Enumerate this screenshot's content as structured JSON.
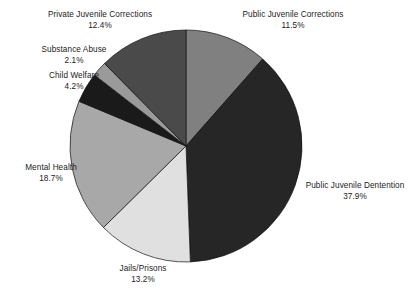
{
  "chart_data": {
    "type": "pie",
    "title": "",
    "subtitle": "",
    "xlabel": "",
    "ylabel": "",
    "legend_position": "none",
    "grid": false,
    "labels_show_percent": true,
    "start_angle_deg": 0,
    "direction": "clockwise",
    "categories": [
      "Public Juvenile Corrections",
      "Public Juvenile Dentention",
      "Jails/Prisons",
      "Mental Health",
      "Child Welfare",
      "Substance Abuse",
      "Private Juvenile Corrections"
    ],
    "values": [
      11.5,
      37.9,
      13.2,
      18.7,
      4.2,
      2.1,
      12.4
    ],
    "units": "percent",
    "total": 100.0,
    "slices": [
      {
        "label": "Public Juvenile Corrections",
        "percent_text": "11.5%",
        "value": 11.5,
        "color": "#808080"
      },
      {
        "label": "Public Juvenile Dentention",
        "percent_text": "37.9%",
        "value": 37.9,
        "color": "#262626"
      },
      {
        "label": "Jails/Prisons",
        "percent_text": "13.2%",
        "value": 13.2,
        "color": "#e0e0e0"
      },
      {
        "label": "Mental Health",
        "percent_text": "18.7%",
        "value": 18.7,
        "color": "#a8a8a8"
      },
      {
        "label": "Child Welfare",
        "percent_text": "4.2%",
        "value": 4.2,
        "color": "#1a1a1a"
      },
      {
        "label": "Substance Abuse",
        "percent_text": "2.1%",
        "value": 2.1,
        "color": "#9a9a9a"
      },
      {
        "label": "Private Juvenile Corrections",
        "percent_text": "12.4%",
        "value": 12.4,
        "color": "#4a4a4a"
      }
    ]
  },
  "colors": {
    "background": "#ffffff",
    "text": "#1b1b1b",
    "slice_outline": "#111111"
  }
}
